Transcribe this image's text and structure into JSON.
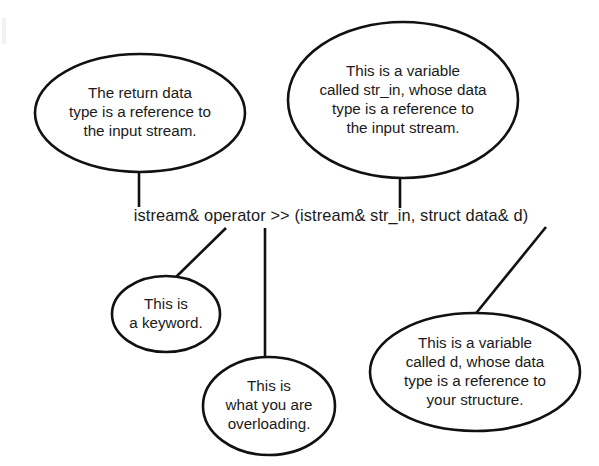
{
  "diagram": {
    "background_color": "#ffffff",
    "line_color": "#111111",
    "text_color": "#1a1a1a",
    "code_line": {
      "full_text": "istream& operator >> (istream& str_in, struct data& d)",
      "center_x": 331,
      "center_y": 217
    },
    "callouts": [
      {
        "id": "return-type",
        "lines": [
          "The return data",
          "type is a reference to",
          "the input stream."
        ],
        "cx": 140,
        "cy": 113,
        "rx": 105,
        "ry": 59,
        "line_height": 19
      },
      {
        "id": "str-in-variable",
        "lines": [
          "This is a variable",
          "called str_in, whose data",
          "type is a reference to",
          "the input stream."
        ],
        "cx": 403,
        "cy": 100,
        "rx": 115,
        "ry": 78,
        "line_height": 19
      },
      {
        "id": "keyword",
        "lines": [
          "This is",
          "a keyword."
        ],
        "cx": 166,
        "cy": 314,
        "rx": 54,
        "ry": 38,
        "line_height": 19
      },
      {
        "id": "overloading",
        "lines": [
          "This is",
          "what you are",
          "overloading."
        ],
        "cx": 269,
        "cy": 406,
        "rx": 66,
        "ry": 49,
        "line_height": 19
      },
      {
        "id": "d-variable",
        "lines": [
          "This is a variable",
          "called d, whose data",
          "type is a reference to",
          "your structure."
        ],
        "cx": 475,
        "cy": 372,
        "rx": 105,
        "ry": 59,
        "line_height": 19
      }
    ],
    "connectors": [
      {
        "id": "return-type-connector",
        "x1": 139,
        "y1": 172,
        "x2": 139,
        "y2": 207
      },
      {
        "id": "str-in-connector",
        "x1": 400,
        "y1": 178,
        "x2": 400,
        "y2": 208
      },
      {
        "id": "keyword-connector",
        "x1": 226,
        "y1": 228,
        "x2": 176,
        "y2": 277
      },
      {
        "id": "overloading-connector",
        "x1": 265,
        "y1": 228,
        "x2": 265,
        "y2": 357
      },
      {
        "id": "d-variable-connector",
        "x1": 546,
        "y1": 227,
        "x2": 473,
        "y2": 317
      }
    ]
  }
}
